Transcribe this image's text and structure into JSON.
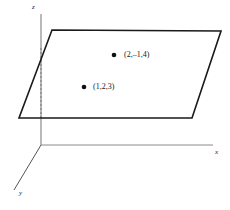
{
  "figure": {
    "background_color": "#ffffff",
    "width": 230,
    "height": 210
  },
  "axes": {
    "origin": {
      "x": 41,
      "y": 145
    },
    "z": {
      "name": "z-axis",
      "label": "z",
      "color": "#8a8a8a",
      "from": {
        "x": 41,
        "y": 145
      },
      "to": {
        "x": 41,
        "y": 14
      }
    },
    "x": {
      "name": "x-axis",
      "label": "x",
      "color": "#8a8a8a",
      "from": {
        "x": 41,
        "y": 145
      },
      "to": {
        "x": 213,
        "y": 145
      }
    },
    "y": {
      "name": "y-axis",
      "label": "y",
      "color": "#555555",
      "from": {
        "x": 41,
        "y": 145
      },
      "to": {
        "x": 14,
        "y": 190
      }
    }
  },
  "plane": {
    "name": "plane",
    "stroke_color": "#1a1a1a",
    "fill_color": "none",
    "stroke_width": 1.6,
    "corners": [
      {
        "x": 52,
        "y": 30
      },
      {
        "x": 221,
        "y": 31
      },
      {
        "x": 192,
        "y": 118
      },
      {
        "x": 19,
        "y": 118
      }
    ]
  },
  "hidden_edge": {
    "name": "dashed-hidden-edge",
    "color": "#777777",
    "dash": "2,2",
    "from": {
      "x": 41,
      "y": 48
    },
    "to": {
      "x": 41,
      "y": 118
    }
  },
  "points": [
    {
      "id": "point-2-neg1-4",
      "label": "(2,–1,4)",
      "dot": {
        "x": 114,
        "y": 55
      },
      "radius": 2.3,
      "color": "#111111"
    },
    {
      "id": "point-1-2-3",
      "label": "(1,2,3)",
      "dot": {
        "x": 84,
        "y": 87
      },
      "radius": 2.3,
      "color": "#111111"
    }
  ],
  "chart_data": {
    "type": "scatter",
    "title": "",
    "xlabel": "x",
    "ylabel": "y",
    "zlabel": "z",
    "projection": "3d-oblique",
    "grid": false,
    "legend": null,
    "annotations": [
      "(2,–1,4)",
      "(1,2,3)"
    ],
    "series": [
      {
        "name": "plotted points",
        "points": [
          {
            "label": "(2,–1,4)",
            "x": 2,
            "y": -1,
            "z": 4
          },
          {
            "label": "(1,2,3)",
            "x": 1,
            "y": 2,
            "z": 3
          }
        ]
      }
    ],
    "shapes": [
      {
        "type": "plane",
        "description": "parallelogram representing a plane containing the two points"
      }
    ]
  }
}
